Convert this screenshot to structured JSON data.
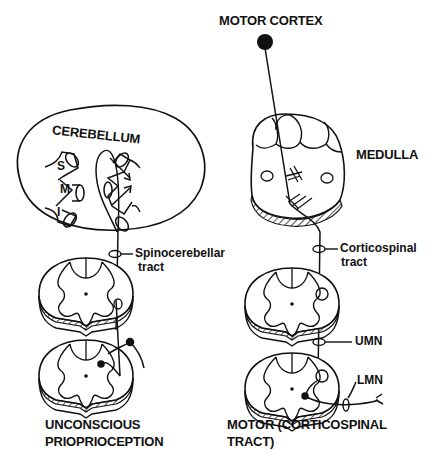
{
  "labels": {
    "motor_cortex": "MOTOR CORTEX",
    "cerebellum": "CEREBELLUM",
    "medulla": "MEDULLA",
    "folia_s": "S",
    "folia_m": "M",
    "folia_i": "I",
    "spinocerebellar_1": "Spinocerebellar",
    "spinocerebellar_2": "tract",
    "corticospinal_1": "Corticospinal",
    "corticospinal_2": "tract",
    "umn": "UMN",
    "lmn": "LMN",
    "left_caption_1": "UNCONSCIOUS",
    "left_caption_2": "PRIOPRIOCEPTION",
    "right_caption_1": "MOTOR (CORTICOSPINAL",
    "right_caption_2": "TRACT)"
  },
  "colors": {
    "ink": "#111111",
    "background": "#ffffff"
  }
}
